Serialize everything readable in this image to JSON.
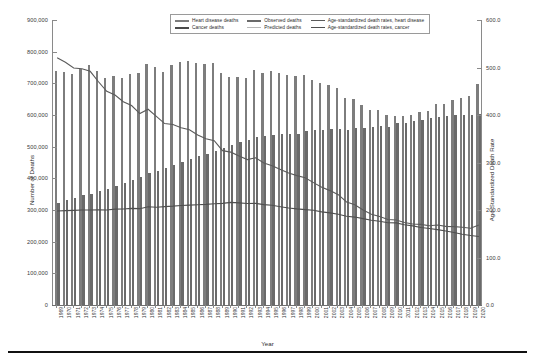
{
  "chart_data": {
    "type": "bar",
    "title": "",
    "xlabel": "Year",
    "ylabel": "Number of Deaths",
    "ylabel_right": "Age-Standardized Death Rate",
    "ylim": [
      0,
      900000
    ],
    "ylim_right": [
      0,
      600.0
    ],
    "grid": false,
    "legend_position": "top-center",
    "y_ticks_left": [
      "0",
      "100,000",
      "200,000",
      "300,000",
      "400,000",
      "500,000",
      "600,000",
      "700,000",
      "800,000",
      "900,000"
    ],
    "y_ticks_right": [
      "0.0",
      "100.0",
      "200.0",
      "300.0",
      "400.0",
      "500.0",
      "600.0"
    ],
    "categories": [
      "1969",
      "1970",
      "1971",
      "1972",
      "1973",
      "1974",
      "1975",
      "1976",
      "1977",
      "1978",
      "1979",
      "1980",
      "1981",
      "1982",
      "1983",
      "1984",
      "1985",
      "1986",
      "1987",
      "1988",
      "1989",
      "1990",
      "1991",
      "1992",
      "1993",
      "1994",
      "1995",
      "1996",
      "1997",
      "1998",
      "1999",
      "2000",
      "2001",
      "2002",
      "2003",
      "2004",
      "2005",
      "2006",
      "2007",
      "2008",
      "2009",
      "2010",
      "2011",
      "2012",
      "2013",
      "2014",
      "2015",
      "2016",
      "2017",
      "2018",
      "2019",
      "2020"
    ],
    "series": [
      {
        "name": "Heart disease deaths",
        "axis": "left",
        "kind": "bar",
        "color": "#7d7d7d",
        "values": [
          739000,
          735000,
          731000,
          744000,
          757000,
          740000,
          716000,
          723000,
          718000,
          729000,
          733000,
          761000,
          753000,
          735000,
          757000,
          766000,
          771000,
          765000,
          760000,
          765000,
          733000,
          720000,
          720000,
          717000,
          743000,
          733000,
          738000,
          733000,
          727000,
          724000,
          726000,
          710000,
          700000,
          696000,
          685000,
          654000,
          652000,
          631000,
          616000,
          617000,
          600000,
          597000,
          597000,
          600000,
          611000,
          614000,
          634000,
          636000,
          647000,
          655000,
          659000,
          697000
        ]
      },
      {
        "name": "Cancer deaths",
        "axis": "left",
        "kind": "bar",
        "color": "#6a6a6a",
        "values": [
          323000,
          331000,
          337000,
          347000,
          351000,
          360000,
          365000,
          377000,
          386000,
          396000,
          403000,
          416000,
          422000,
          433000,
          443000,
          453000,
          462000,
          469000,
          477000,
          485000,
          496000,
          505000,
          514000,
          521000,
          530000,
          534000,
          538000,
          539000,
          539000,
          541000,
          549000,
          553000,
          553000,
          557000,
          556000,
          553000,
          559000,
          559000,
          562000,
          566000,
          562000,
          574000,
          576000,
          582000,
          585000,
          591000,
          595000,
          598000,
          599000,
          599000,
          599000,
          602000
        ]
      },
      {
        "name": "Age-standardized death rates, heart disease",
        "axis": "right",
        "kind": "line",
        "color": "#5a5a5a",
        "values": [
          520.4,
          511.0,
          499.0,
          497.5,
          492.0,
          470.0,
          450.0,
          442.0,
          428.0,
          420.0,
          403.0,
          412.1,
          397.0,
          382.0,
          380.0,
          373.0,
          369.0,
          358.0,
          350.0,
          346.0,
          325.0,
          321.8,
          313.8,
          306.1,
          309.9,
          299.0,
          293.4,
          285.5,
          277.9,
          272.4,
          267.8,
          257.6,
          247.8,
          240.8,
          232.3,
          217.0,
          211.1,
          200.2,
          190.9,
          186.5,
          180.1,
          179.1,
          173.7,
          170.5,
          169.8,
          167.0,
          168.5,
          165.5,
          165.0,
          163.6,
          161.5,
          168.2
        ]
      },
      {
        "name": "Age-standardized death rates, cancer",
        "axis": "right",
        "kind": "line",
        "color": "#4f4f4f",
        "values": [
          198.0,
          198.6,
          199.2,
          200.1,
          200.0,
          200.5,
          200.1,
          201.8,
          202.0,
          203.4,
          202.8,
          207.0,
          205.8,
          207.2,
          208.1,
          209.5,
          210.2,
          211.0,
          211.8,
          213.0,
          214.0,
          216.0,
          215.0,
          213.6,
          213.9,
          211.3,
          209.9,
          207.0,
          204.3,
          202.3,
          200.8,
          199.6,
          196.0,
          194.0,
          190.9,
          186.8,
          185.1,
          181.8,
          178.4,
          176.4,
          173.2,
          172.8,
          169.0,
          166.5,
          163.2,
          161.2,
          158.7,
          155.8,
          152.5,
          149.1,
          146.2,
          144.1
        ]
      }
    ],
    "annotations": []
  },
  "legend": {
    "items": [
      {
        "label": "Heart disease deaths",
        "color": "#7d7d7d",
        "thickness": "2.2px"
      },
      {
        "label": "Observed deaths",
        "color": "#6a6a6a",
        "thickness": "2.2px"
      },
      {
        "label": "Age-standardized death rates, heart disease",
        "color": "#5a5a5a",
        "thickness": "1px"
      },
      {
        "label": "Cancer deaths",
        "color": "#4a4a4a",
        "thickness": "2.2px"
      },
      {
        "label": "Predicted deaths",
        "color": "#b8b8b8",
        "thickness": "1px"
      },
      {
        "label": "Age-standardized death rates, cancer",
        "color": "#4f4f4f",
        "thickness": "1.4px"
      }
    ]
  }
}
